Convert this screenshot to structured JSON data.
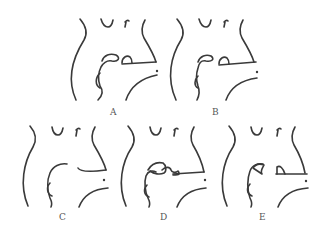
{
  "figure": {
    "panels": [
      {
        "id": "A",
        "label": "A"
      },
      {
        "id": "B",
        "label": "B"
      },
      {
        "id": "C",
        "label": "C"
      },
      {
        "id": "D",
        "label": "D"
      },
      {
        "id": "E",
        "label": "E"
      }
    ],
    "colors": {
      "line": "#3a3a3a",
      "label": "#555555",
      "background": "#ffffff"
    }
  }
}
